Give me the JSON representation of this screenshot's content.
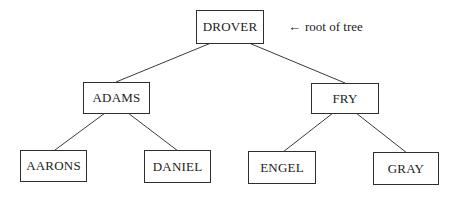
{
  "diagram": {
    "type": "binary-search-tree",
    "root": {
      "label": "DROVER",
      "annotation": {
        "arrow": "←",
        "text": "root of tree"
      },
      "left": {
        "label": "ADAMS",
        "left": {
          "label": "AARONS"
        },
        "right": {
          "label": "DANIEL"
        }
      },
      "right": {
        "label": "FRY",
        "left": {
          "label": "ENGEL"
        },
        "right": {
          "label": "GRAY"
        }
      }
    },
    "nodes": [
      {
        "id": "drover",
        "label": "DROVER",
        "level": 0
      },
      {
        "id": "adams",
        "label": "ADAMS",
        "level": 1
      },
      {
        "id": "fry",
        "label": "FRY",
        "level": 1
      },
      {
        "id": "aarons",
        "label": "AARONS",
        "level": 2
      },
      {
        "id": "daniel",
        "label": "DANIEL",
        "level": 2
      },
      {
        "id": "engel",
        "label": "ENGEL",
        "level": 2
      },
      {
        "id": "gray",
        "label": "GRAY",
        "level": 2
      }
    ],
    "edges": [
      {
        "from": "DROVER",
        "to": "ADAMS"
      },
      {
        "from": "DROVER",
        "to": "FRY"
      },
      {
        "from": "ADAMS",
        "to": "AARONS"
      },
      {
        "from": "ADAMS",
        "to": "DANIEL"
      },
      {
        "from": "FRY",
        "to": "ENGEL"
      },
      {
        "from": "FRY",
        "to": "GRAY"
      }
    ],
    "colors": {
      "background": "#ffffff",
      "stroke": "#2e2e2e",
      "text": "#222222"
    }
  }
}
